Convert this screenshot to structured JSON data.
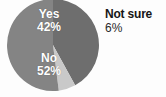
{
  "chart_data": {
    "type": "pie",
    "title": "",
    "subtitle": "",
    "xlabel": "",
    "ylabel": "",
    "legend_position": "none",
    "grid": false,
    "categories": [
      "Yes",
      "No",
      "Not sure"
    ],
    "values": [
      42,
      52,
      6
    ],
    "unit": "%",
    "start_angle_deg": 0,
    "direction": "clockwise",
    "slices": [
      {
        "label": "Yes",
        "value": 42,
        "value_text": "42%",
        "color": "#6e6e6e",
        "label_placement": "inside",
        "label_color": "#ffffff"
      },
      {
        "label": "Not sure",
        "value": 6,
        "value_text": "6%",
        "color": "#c9c9c9",
        "label_placement": "outside",
        "label_color": "#161616"
      },
      {
        "label": "No",
        "value": 52,
        "value_text": "52%",
        "color": "#848484",
        "label_placement": "inside",
        "label_color": "#ffffff"
      }
    ]
  },
  "chart": {
    "background_color": "#fdfdfd",
    "center_x": 53,
    "center_y": 45,
    "radius": 46
  },
  "labels": {
    "yes": {
      "name": "Yes",
      "percent": "42%"
    },
    "no": {
      "name": "No",
      "percent": "52%"
    },
    "not_sure": {
      "name": "Not sure",
      "percent": "6%"
    }
  }
}
